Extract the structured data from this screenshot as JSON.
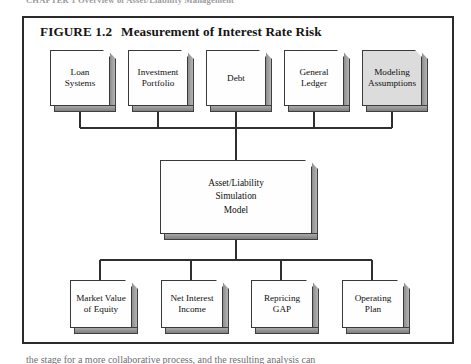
{
  "page": {
    "running_header": "CHAPTER 1   Overview of Asset/Liability Management",
    "body_text_below": "the stage for a more collaborative process, and the resulting analysis can"
  },
  "figure": {
    "number_label": "FIGURE 1.2",
    "title": "Measurement of Interest Rate Risk",
    "frame_color": "#2b2b2b",
    "box_fill": "#fefefe",
    "box_shaded_fill": "#dcdcdc",
    "box_border": "#3a3a3a",
    "shadow_color": "#8d8d8d",
    "connector_color": "#2f2f2f"
  },
  "inputs": {
    "section_role": "data sources",
    "boxes": [
      {
        "line1": "Loan",
        "line2": "Systems",
        "shaded": false
      },
      {
        "line1": "Investment",
        "line2": "Portfolio",
        "shaded": false
      },
      {
        "line1": "Debt",
        "line2": "",
        "shaded": false
      },
      {
        "line1": "General",
        "line2": "Ledger",
        "shaded": false
      },
      {
        "line1": "Modeling",
        "line2": "Assumptions",
        "shaded": true
      }
    ]
  },
  "model": {
    "line1": "Asset/Liability",
    "line2": "Simulation",
    "line3": "Model"
  },
  "outputs": {
    "section_role": "model results",
    "boxes": [
      {
        "line1": "Market Value",
        "line2": "of Equity"
      },
      {
        "line1": "Net Interest",
        "line2": "Income"
      },
      {
        "line1": "Repricing",
        "line2": "GAP"
      },
      {
        "line1": "Operating",
        "line2": "Plan"
      }
    ]
  }
}
